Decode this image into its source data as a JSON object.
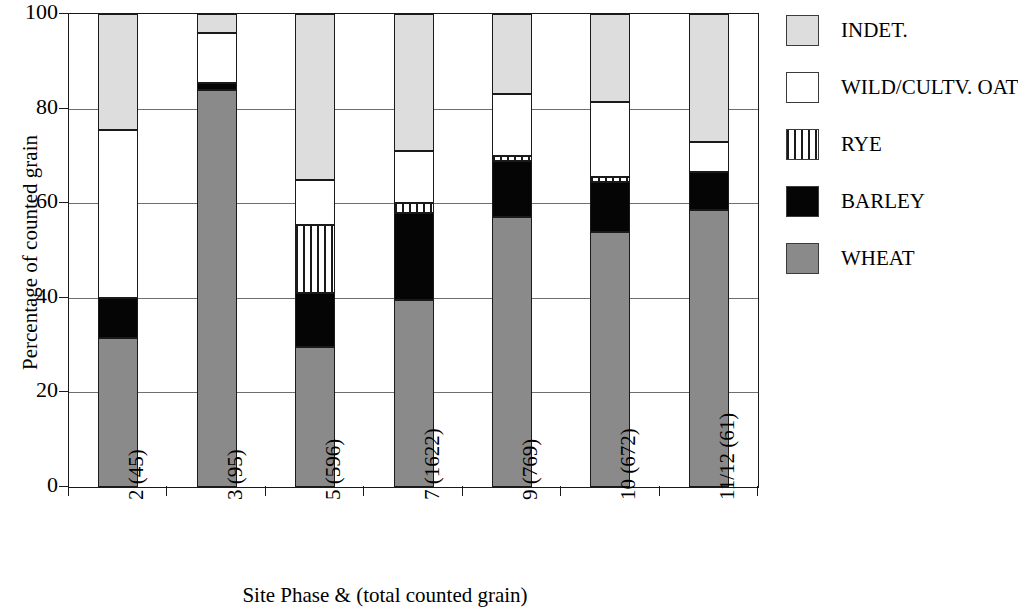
{
  "chart_data": {
    "type": "bar",
    "subtype": "stacked-bar-100-percent",
    "title": "",
    "xlabel": "Site Phase & (total counted grain)",
    "ylabel": "Percentage of counted grain",
    "ylim": [
      0,
      100
    ],
    "ytick_labels": [
      "0",
      "20",
      "40",
      "60",
      "80",
      "100"
    ],
    "yticks": [
      0,
      20,
      40,
      60,
      80,
      100
    ],
    "grid": "horizontal",
    "legend_position": "right",
    "categories": [
      "2 (45)",
      "3 (95)",
      "5 (596)",
      "7 (1622)",
      "9 (769)",
      "10 (672)",
      "11/12 (61)"
    ],
    "phases": [
      "2",
      "3",
      "5",
      "7",
      "9",
      "10",
      "11/12"
    ],
    "totals": [
      45,
      95,
      596,
      1622,
      769,
      672,
      61
    ],
    "series": [
      {
        "name": "WHEAT",
        "color": "#8a8a8a",
        "values": [
          31.5,
          84.0,
          29.5,
          39.5,
          57.0,
          54.0,
          58.5
        ]
      },
      {
        "name": "BARLEY",
        "color": "#050505",
        "values": [
          8.5,
          1.5,
          11.5,
          18.5,
          12.0,
          10.5,
          8.0
        ]
      },
      {
        "name": "RYE",
        "color": "#ffffff",
        "values": [
          0.0,
          0.0,
          14.5,
          2.0,
          1.0,
          1.0,
          0.0
        ]
      },
      {
        "name": "WILD/CULTV. OAT",
        "color": "#ffffff",
        "values": [
          35.5,
          10.5,
          9.5,
          11.0,
          13.0,
          16.0,
          6.5
        ]
      },
      {
        "name": "INDET.",
        "color": "#dddddd",
        "values": [
          24.5,
          4.0,
          35.0,
          29.0,
          17.0,
          18.5,
          27.0
        ]
      }
    ],
    "cumulative_tops": [
      [
        31.5,
        40.0,
        40.0,
        75.5,
        100.0
      ],
      [
        84.0,
        85.5,
        85.5,
        96.0,
        100.0
      ],
      [
        29.5,
        41.0,
        55.5,
        65.0,
        100.0
      ],
      [
        39.5,
        58.0,
        60.0,
        71.0,
        100.0
      ],
      [
        57.0,
        69.0,
        70.0,
        83.0,
        100.0
      ],
      [
        54.0,
        64.5,
        65.5,
        81.5,
        100.0
      ],
      [
        58.5,
        66.5,
        66.5,
        73.0,
        100.0
      ]
    ]
  },
  "axes": {
    "y_title": "Percentage of counted grain",
    "x_title": "Site Phase & (total counted grain)",
    "y_ticks": [
      "100",
      "80",
      "60",
      "40",
      "20",
      "0"
    ],
    "x_ticks": [
      "2 (45)",
      "3 (95)",
      "5 (596)",
      "7 (1622)",
      "9 (769)",
      "10 (672)",
      "11/12 (61)"
    ]
  },
  "legend": {
    "items": [
      {
        "label": "INDET.",
        "swatch": "indet-swatch"
      },
      {
        "label": "WILD/CULTV. OAT",
        "swatch": "oat-swatch"
      },
      {
        "label": "RYE",
        "swatch": "rye-swatch"
      },
      {
        "label": "BARLEY",
        "swatch": "barley-swatch"
      },
      {
        "label": "WHEAT",
        "swatch": "wheat-swatch"
      }
    ]
  }
}
